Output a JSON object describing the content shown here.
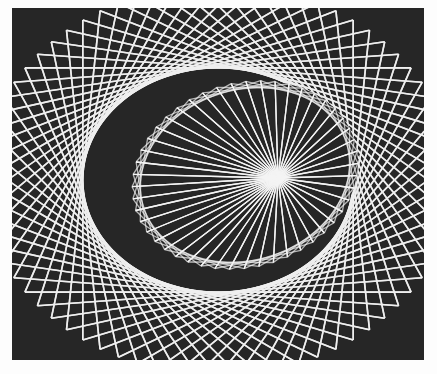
{
  "image": {
    "subject": "string art photograph",
    "description": "White straight threads on a dark background forming an outer elliptical envelope and an inner tilted elliptical rosette with a bright central convergence point",
    "background_color": "#262626",
    "thread_color": "#eeeeee",
    "paper_color": "#fdfdfd",
    "pattern": {
      "outer_ellipse": {
        "cx": 218,
        "cy": 180,
        "rx": 205,
        "ry": 170
      },
      "inner_ellipse": {
        "cx": 245,
        "cy": 175,
        "rx": 115,
        "ry": 92,
        "rotation_deg": -18
      },
      "focal_point": {
        "x": 278,
        "y": 178
      },
      "outer_chords": 72,
      "outer_skip": 22,
      "inner_spokes": 48
    }
  }
}
